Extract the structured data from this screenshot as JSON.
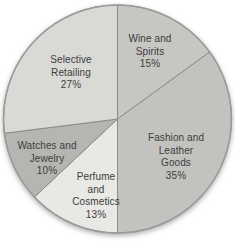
{
  "chart_data": {
    "type": "pie",
    "title": "",
    "unit": "%",
    "start_angle_deg": 0,
    "direction": "clockwise",
    "legend": "none",
    "categories": [
      "Wine and Spirits",
      "Fashion and Leather Goods",
      "Perfume and Cosmetics",
      "Watches and Jewelry",
      "Selective Retailing"
    ],
    "values": [
      15,
      35,
      13,
      10,
      27
    ],
    "slices": [
      {
        "name": "wine-and-spirits",
        "value": 15,
        "color": "#c6c6c3",
        "label_lines": [
          "Wine and",
          "Spirits",
          "15%"
        ],
        "label_pos": {
          "x": 150,
          "y": 52
        }
      },
      {
        "name": "fashion-and-leather-goods",
        "value": 35,
        "color": "#c2c2bf",
        "label_lines": [
          "Fashion and",
          "Leather",
          "Goods",
          "35%"
        ],
        "label_pos": {
          "x": 176,
          "y": 157
        }
      },
      {
        "name": "perfume-and-cosmetics",
        "value": 13,
        "color": "#e8e8e4",
        "label_lines": [
          "Perfume",
          "and",
          "Cosmetics",
          "13%"
        ],
        "label_pos": {
          "x": 96,
          "y": 196
        }
      },
      {
        "name": "watches-and-jewelry",
        "value": 10,
        "color": "#b5b5b2",
        "label_lines": [
          "Watches and",
          "Jewelry",
          "10%"
        ],
        "label_pos": {
          "x": 47,
          "y": 159
        }
      },
      {
        "name": "selective-retailing",
        "value": 27,
        "color": "#d9d9d6",
        "label_lines": [
          "Selective",
          "Retailing",
          "27%"
        ],
        "label_pos": {
          "x": 71,
          "y": 73
        }
      }
    ],
    "geometry": {
      "cx": 117.5,
      "cy": 119,
      "r": 114
    },
    "styles": {
      "divider_color": "#8c8c8c",
      "outline_color": "#9b9b9b",
      "text_color": "#3d3d3d",
      "background": "#ffffff"
    }
  }
}
